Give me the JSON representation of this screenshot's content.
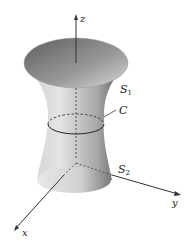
{
  "figure": {
    "axes": {
      "z": "z",
      "y": "y",
      "x": "x"
    },
    "labels": {
      "s1": "S",
      "s1_sub": "1",
      "c": "C",
      "s2": "S",
      "s2_sub": "2"
    },
    "colors": {
      "surface_light": "#e2e2e2",
      "surface_mid": "#b8b8b8",
      "surface_dark": "#5a5a5a",
      "top_inner": "#8a8a8a",
      "bottom_cap": "#d6d6d6",
      "axis": "#333333"
    }
  }
}
